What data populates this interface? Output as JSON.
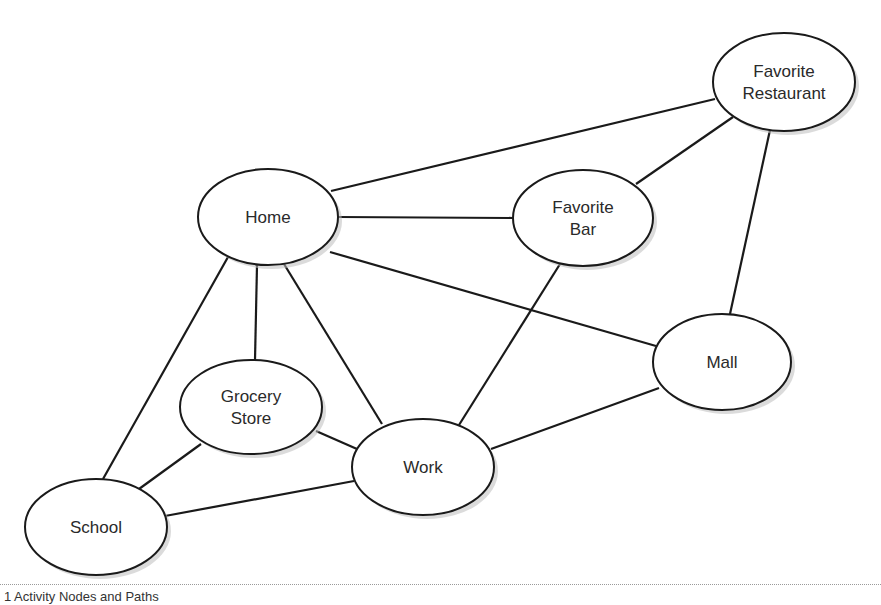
{
  "figure": {
    "caption": "1  Activity Nodes and Paths",
    "colors": {
      "stroke": "#1a1a1a",
      "fill": "#ffffff",
      "shadow": "#bdbdbd",
      "text": "#2a2a2a"
    }
  },
  "nodes": [
    {
      "id": "restaurant",
      "lines": [
        "Favorite",
        "Restaurant"
      ],
      "cx": 784,
      "cy": 82,
      "rx": 71,
      "ry": 49
    },
    {
      "id": "home",
      "lines": [
        "Home"
      ],
      "cx": 268,
      "cy": 217,
      "rx": 70,
      "ry": 48
    },
    {
      "id": "bar",
      "lines": [
        "Favorite",
        "Bar"
      ],
      "cx": 583,
      "cy": 218,
      "rx": 70,
      "ry": 48
    },
    {
      "id": "mall",
      "lines": [
        "Mall"
      ],
      "cx": 722,
      "cy": 362,
      "rx": 69,
      "ry": 48
    },
    {
      "id": "grocery",
      "lines": [
        "Grocery",
        "Store"
      ],
      "cx": 251,
      "cy": 407,
      "rx": 71,
      "ry": 47
    },
    {
      "id": "work",
      "lines": [
        "Work"
      ],
      "cx": 423,
      "cy": 467,
      "rx": 71,
      "ry": 48
    },
    {
      "id": "school",
      "lines": [
        "School"
      ],
      "cx": 96,
      "cy": 527,
      "rx": 71,
      "ry": 48
    }
  ],
  "edges": [
    {
      "from": "home",
      "to": "restaurant",
      "x1": 331,
      "y1": 191,
      "x2": 715,
      "y2": 99
    },
    {
      "from": "bar",
      "to": "restaurant",
      "x1": 636,
      "y1": 184,
      "x2": 733,
      "y2": 117
    },
    {
      "from": "mall",
      "to": "restaurant",
      "x1": 730,
      "y1": 314,
      "x2": 770,
      "y2": 130
    },
    {
      "from": "home",
      "to": "bar",
      "x1": 338,
      "y1": 217,
      "x2": 513,
      "y2": 218
    },
    {
      "from": "home",
      "to": "mall",
      "x1": 330,
      "y1": 252,
      "x2": 656,
      "y2": 346
    },
    {
      "from": "home",
      "to": "grocery",
      "x1": 257,
      "y1": 265,
      "x2": 255,
      "y2": 360
    },
    {
      "from": "home",
      "to": "work",
      "x1": 284,
      "y1": 264,
      "x2": 382,
      "y2": 424
    },
    {
      "from": "home",
      "to": "school",
      "x1": 228,
      "y1": 257,
      "x2": 103,
      "y2": 479
    },
    {
      "from": "bar",
      "to": "work",
      "x1": 560,
      "y1": 264,
      "x2": 459,
      "y2": 425
    },
    {
      "from": "mall",
      "to": "work",
      "x1": 659,
      "y1": 388,
      "x2": 491,
      "y2": 449
    },
    {
      "from": "grocery",
      "to": "work",
      "x1": 316,
      "y1": 431,
      "x2": 357,
      "y2": 449
    },
    {
      "from": "grocery",
      "to": "school",
      "x1": 201,
      "y1": 444,
      "x2": 139,
      "y2": 489
    },
    {
      "from": "work",
      "to": "school",
      "x1": 354,
      "y1": 481,
      "x2": 165,
      "y2": 516
    }
  ]
}
